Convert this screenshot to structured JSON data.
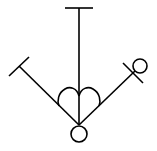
{
  "diagram": {
    "stroke_color": "#000000",
    "background_color": "#ffffff",
    "elements": [
      {
        "name": "top-t-bar",
        "type": "line"
      },
      {
        "name": "center-vertical-line",
        "type": "line"
      },
      {
        "name": "left-diagonal-line",
        "type": "line"
      },
      {
        "name": "left-crossbar",
        "type": "line"
      },
      {
        "name": "right-diagonal-line",
        "type": "line"
      },
      {
        "name": "right-crossbar",
        "type": "line"
      },
      {
        "name": "right-circle",
        "type": "circle"
      },
      {
        "name": "heart-shape",
        "type": "path"
      },
      {
        "name": "bottom-circle",
        "type": "circle"
      }
    ]
  }
}
